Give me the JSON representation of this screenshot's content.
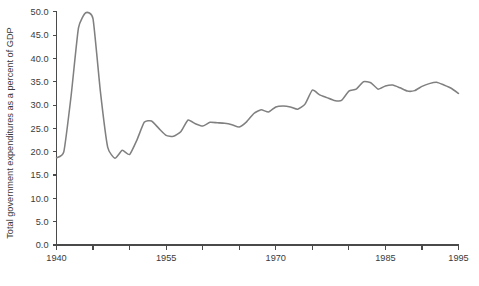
{
  "chart_data": {
    "type": "line",
    "title": "",
    "subtitle": "",
    "xlabel": "",
    "ylabel": "Total government expenditures as a percent of GDP",
    "xlim": [
      1940,
      1995
    ],
    "ylim": [
      0.0,
      50.0
    ],
    "grid": false,
    "legend": null,
    "line_color": "#808080",
    "axis_color": "#4a4a4a",
    "text_color": "#3a3a3a",
    "background": "#ffffff",
    "x_ticks": [
      1940,
      1945,
      1950,
      1955,
      1960,
      1965,
      1970,
      1975,
      1980,
      1985,
      1990,
      1995
    ],
    "x_tick_labels": [
      "1940",
      "",
      "",
      "1955",
      "",
      "",
      "1970",
      "",
      "",
      "1985",
      "",
      "1995"
    ],
    "y_ticks": [
      0.0,
      5.0,
      10.0,
      15.0,
      20.0,
      25.0,
      30.0,
      35.0,
      40.0,
      45.0,
      50.0
    ],
    "y_tick_labels": [
      "0.0",
      "5.0",
      "10.0",
      "15.0",
      "20.0",
      "25.0",
      "30.0",
      "35.0",
      "40.0",
      "45.0",
      "50.0"
    ],
    "series": [
      {
        "name": "Total government expenditures as a percent of GDP",
        "x": [
          1940,
          1941,
          1942,
          1943,
          1944,
          1945,
          1946,
          1947,
          1948,
          1949,
          1950,
          1951,
          1952,
          1953,
          1954,
          1955,
          1956,
          1957,
          1958,
          1959,
          1960,
          1961,
          1962,
          1963,
          1964,
          1965,
          1966,
          1967,
          1968,
          1969,
          1970,
          1971,
          1972,
          1973,
          1974,
          1975,
          1976,
          1977,
          1978,
          1979,
          1980,
          1981,
          1982,
          1983,
          1984,
          1985,
          1986,
          1987,
          1988,
          1989,
          1990,
          1991,
          1992,
          1993,
          1994,
          1995
        ],
        "values": [
          18.7,
          20.0,
          32.0,
          46.5,
          49.8,
          48.5,
          33.0,
          21.0,
          18.6,
          20.3,
          19.4,
          22.5,
          26.3,
          26.6,
          25.0,
          23.5,
          23.3,
          24.3,
          26.8,
          26.0,
          25.5,
          26.3,
          26.2,
          26.1,
          25.8,
          25.3,
          26.4,
          28.2,
          29.0,
          28.5,
          29.6,
          29.8,
          29.6,
          29.1,
          30.2,
          33.2,
          32.2,
          31.6,
          31.0,
          31.0,
          33.0,
          33.4,
          35.0,
          34.8,
          33.4,
          34.1,
          34.3,
          33.7,
          33.0,
          33.1,
          34.0,
          34.6,
          34.9,
          34.3,
          33.6,
          32.5
        ]
      }
    ]
  },
  "axis": {
    "y_title": "Total government expenditures as a percent of GDP"
  }
}
